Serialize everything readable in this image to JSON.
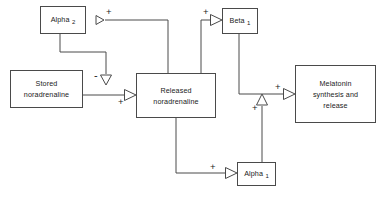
{
  "diagram": {
    "type": "flow-diagram",
    "width": 382,
    "height": 198,
    "line_color": "#4a4a4a",
    "text_color": "#1a1a1a",
    "background": "#ffffff",
    "nodes": [
      {
        "id": "alpha2",
        "name": "Alpha",
        "subscript": "2",
        "x": 40,
        "y": 6,
        "w": 46,
        "h": 28
      },
      {
        "id": "beta1",
        "name": "Beta",
        "subscript": "1",
        "x": 222,
        "y": 8,
        "w": 36,
        "h": 26
      },
      {
        "id": "stored",
        "line1": "Stored",
        "line2": "noradrenaline",
        "x": 10,
        "y": 70,
        "w": 73,
        "h": 38
      },
      {
        "id": "released",
        "line1": "Released",
        "line2": "noradrenaline",
        "x": 136,
        "y": 73,
        "w": 80,
        "h": 45
      },
      {
        "id": "melatonin",
        "line1": "Melatonin",
        "line2": "synthesis and",
        "line3": "release",
        "x": 295,
        "y": 65,
        "w": 81,
        "h": 58
      },
      {
        "id": "alpha1",
        "name": "Alpha",
        "subscript": "1",
        "x": 237,
        "y": 162,
        "w": 39,
        "h": 24
      }
    ],
    "edges": [
      {
        "id": "released-to-alpha2",
        "from": "released",
        "to": "alpha2",
        "sign": "+",
        "arrow": "left"
      },
      {
        "id": "alpha2-to-release",
        "from": "alpha2",
        "to": "released-noradrenaline-flow",
        "sign": "-",
        "arrow": "down"
      },
      {
        "id": "stored-to-released",
        "from": "stored",
        "to": "released",
        "sign": "+",
        "arrow": "right"
      },
      {
        "id": "released-to-beta1",
        "from": "released",
        "to": "beta1",
        "sign": "+",
        "arrow": "right"
      },
      {
        "id": "beta1-to-melatonin",
        "from": "beta1",
        "to": "melatonin",
        "sign": "+",
        "arrow": "right"
      },
      {
        "id": "released-to-alpha1",
        "from": "released",
        "to": "alpha1",
        "sign": "+",
        "arrow": "right"
      },
      {
        "id": "alpha1-to-beta1-pathway",
        "from": "alpha1",
        "to": "beta1-melatonin-link",
        "sign": "+",
        "arrow": "up"
      }
    ],
    "signs": {
      "alpha2_plus": "+",
      "beta1_plus": "+",
      "inhibit_minus": "-",
      "release_plus": "+",
      "melatonin_plus": "+",
      "alpha1_up_plus": "+",
      "alpha1_plus": "+"
    }
  }
}
